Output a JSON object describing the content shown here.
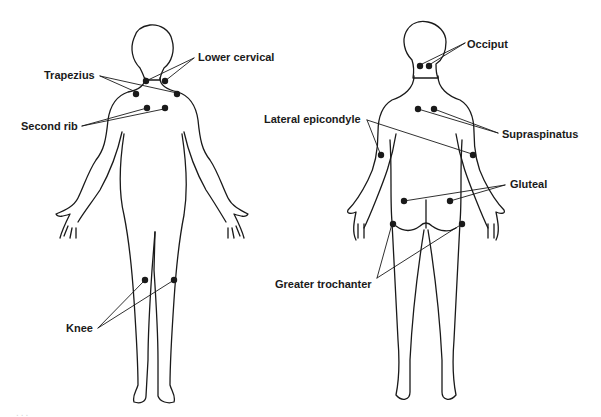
{
  "figure": {
    "front_view": {
      "labels": {
        "trapezius": "Trapezius",
        "lower_cervical": "Lower cervical",
        "second_rib": "Second rib",
        "knee": "Knee"
      }
    },
    "back_view": {
      "labels": {
        "occiput": "Occiput",
        "supraspinatus": "Supraspinatus",
        "lateral_epicondyle": "Lateral epicondyle",
        "gluteal": "Gluteal",
        "greater_trochanter": "Greater trochanter"
      }
    },
    "caption_partial": "..."
  }
}
